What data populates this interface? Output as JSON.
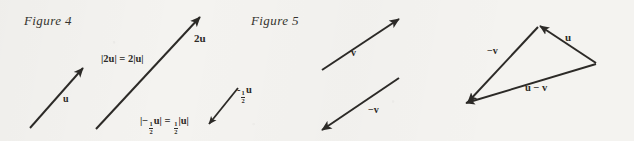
{
  "page": {
    "background_color": "#f4f3f0",
    "ink_color": "#2c2a27",
    "width": 634,
    "height": 141
  },
  "figures": [
    {
      "caption": "Figure 4",
      "topic": "scalar multiplication of a vector",
      "labels": {
        "u": "u",
        "two_u": "2u",
        "magnitude_two_u_prefix": "|2u| = 2|u|",
        "neg_half_u_prefix": "-",
        "neg_half_u_suffix": "u",
        "magnitude_half_open": "|",
        "magnitude_half_minus": "−",
        "magnitude_half_mid": "u| = ",
        "magnitude_half_close": "|u|",
        "fraction_numerator": "1",
        "fraction_denominator": "2"
      }
    },
    {
      "caption": "Figure 5",
      "topic": "vector subtraction u − v",
      "labels": {
        "v": "v",
        "neg_v": "−v",
        "u": "u",
        "triangle_neg_v": "−v",
        "u_minus_v": "u − v"
      }
    }
  ]
}
